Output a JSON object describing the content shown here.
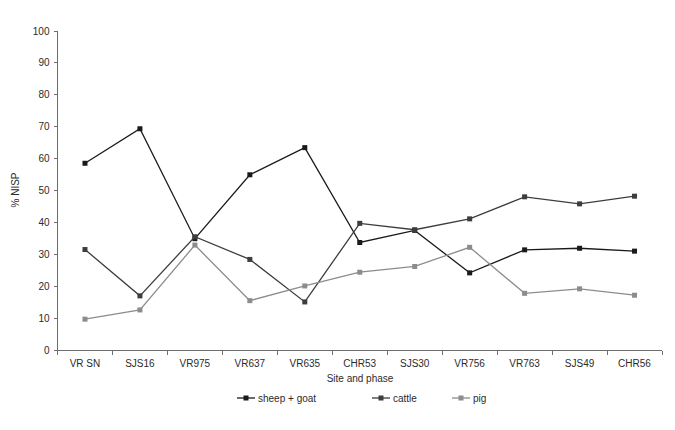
{
  "chart_data": {
    "type": "line",
    "title": "",
    "xlabel": "Site and phase",
    "ylabel": "% NISP",
    "categories": [
      "VR SN",
      "SJS16",
      "VR975",
      "VR637",
      "VR635",
      "CHR53",
      "SJS30",
      "VR756",
      "VR763",
      "SJS49",
      "CHR56"
    ],
    "ylim": [
      0,
      100
    ],
    "ytick_step": 10,
    "yticks": [
      "0",
      "10",
      "20",
      "30",
      "40",
      "50",
      "60",
      "70",
      "80",
      "90",
      "100"
    ],
    "grid": false,
    "legend_position": "bottom",
    "series": [
      {
        "name": "sheep + goat",
        "color": "#1a1a1a",
        "values": [
          58.6,
          69.4,
          35.0,
          55.0,
          63.5,
          33.8,
          37.6,
          24.3,
          31.5,
          32.0,
          31.1
        ]
      },
      {
        "name": "cattle",
        "color": "#3d3d3d",
        "values": [
          31.6,
          17.1,
          35.6,
          28.5,
          15.2,
          39.8,
          37.8,
          41.2,
          48.1,
          45.9,
          48.3
        ]
      },
      {
        "name": "pig",
        "color": "#8c8c8c",
        "values": [
          9.8,
          12.7,
          33.0,
          15.6,
          20.2,
          24.5,
          26.3,
          32.3,
          17.9,
          19.3,
          17.3
        ]
      }
    ]
  },
  "axes": {
    "y_axis_label": "% NISP",
    "x_axis_label": "Site and phase"
  },
  "colors": {
    "sheep_goat": "#1a1a1a",
    "cattle": "#3d3d3d",
    "pig": "#8c8c8c",
    "axis": "#6e6e6e",
    "text": "#2b2b2b",
    "background": "#ffffff"
  }
}
